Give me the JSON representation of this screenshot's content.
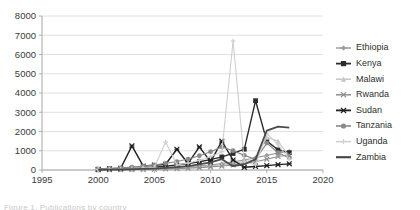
{
  "chart_data": {
    "type": "line",
    "title": "",
    "xlabel": "",
    "ylabel": "",
    "xlim": [
      1995,
      2020
    ],
    "ylim": [
      0,
      8000
    ],
    "ytick_step": 1000,
    "xtick_step": 5,
    "grid": true,
    "legend_position": "right",
    "xticks": [
      "1995",
      "2000",
      "2005",
      "2010",
      "2015",
      "2020"
    ],
    "yticks": [
      "0",
      "1000",
      "2000",
      "3000",
      "4000",
      "5000",
      "6000",
      "7000",
      "8000"
    ],
    "x": [
      2000,
      2001,
      2002,
      2003,
      2004,
      2005,
      2006,
      2007,
      2008,
      2009,
      2010,
      2011,
      2012,
      2013,
      2014,
      2015,
      2016,
      2017
    ],
    "series": [
      {
        "name": "Ethiopia",
        "color": "#9a9a9a",
        "marker": "diamond",
        "width": 1.1,
        "values": [
          20,
          30,
          40,
          60,
          70,
          90,
          110,
          140,
          170,
          200,
          260,
          330,
          420,
          520,
          640,
          760,
          880,
          960
        ]
      },
      {
        "name": "Kenya",
        "color": "#2b2b2b",
        "marker": "square",
        "width": 1.4,
        "values": [
          30,
          45,
          60,
          80,
          110,
          150,
          200,
          260,
          340,
          430,
          540,
          680,
          860,
          1080,
          3600,
          1500,
          1050,
          900
        ]
      },
      {
        "name": "Malawi",
        "color": "#c6c6c6",
        "marker": "triangle",
        "width": 1.1,
        "values": [
          15,
          20,
          28,
          36,
          48,
          62,
          80,
          100,
          130,
          165,
          210,
          270,
          340,
          430,
          540,
          1700,
          1500,
          700
        ]
      },
      {
        "name": "Rwanda",
        "color": "#8e8e8e",
        "marker": "cross",
        "width": 1.1,
        "values": [
          10,
          14,
          20,
          26,
          34,
          44,
          58,
          74,
          96,
          124,
          160,
          205,
          265,
          340,
          430,
          560,
          700,
          780
        ]
      },
      {
        "name": "Sudan",
        "color": "#1f1f1f",
        "marker": "star",
        "width": 1.4,
        "values": [
          40,
          60,
          90,
          1250,
          210,
          250,
          300,
          1080,
          340,
          1200,
          420,
          1500,
          520,
          140,
          180,
          230,
          280,
          320
        ]
      },
      {
        "name": "Tanzania",
        "color": "#8a8a8a",
        "marker": "circle",
        "width": 1.2,
        "values": [
          60,
          80,
          110,
          150,
          200,
          260,
          340,
          440,
          570,
          740,
          950,
          1200,
          1000,
          760,
          560,
          1400,
          900,
          620
        ]
      },
      {
        "name": "Uganda",
        "color": "#cfcfcf",
        "marker": "plus",
        "width": 1.1,
        "values": [
          25,
          35,
          50,
          70,
          100,
          140,
          1450,
          260,
          360,
          500,
          690,
          950,
          6700,
          420,
          260,
          1900,
          1300,
          560
        ]
      },
      {
        "name": "Zambia",
        "color": "#4a4a4a",
        "marker": "none",
        "width": 1.8,
        "values": [
          12,
          18,
          26,
          38,
          54,
          76,
          106,
          148,
          206,
          288,
          402,
          560,
          200,
          300,
          560,
          2050,
          2250,
          2200
        ]
      }
    ],
    "legend": [
      "Ethiopia",
      "Kenya",
      "Malawi",
      "Rwanda",
      "Sudan",
      "Tanzania",
      "Uganda",
      "Zambia"
    ]
  },
  "caption": {
    "text": "Figure 1. Publications by country"
  }
}
